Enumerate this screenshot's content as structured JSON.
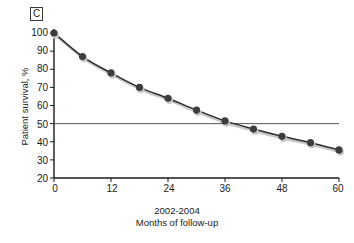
{
  "panel": {
    "label": "C"
  },
  "chart_data": {
    "type": "line",
    "title": "",
    "subtitle": "",
    "xlabel": "Months of follow-up",
    "xlabel_secondary": "2002-2004",
    "ylabel": "Patient survival, %",
    "xlim": [
      0,
      60
    ],
    "ylim": [
      20,
      100
    ],
    "grid": false,
    "legend": null,
    "x": [
      0,
      6,
      12,
      18,
      24,
      30,
      36,
      42,
      48,
      54,
      60
    ],
    "values": [
      100,
      87,
      78,
      70,
      64,
      57.5,
      51.5,
      47,
      43,
      39.5,
      35.5
    ],
    "series": [
      {
        "name": "Patient survival",
        "values": [
          100,
          87,
          78,
          70,
          64,
          57.5,
          51.5,
          47,
          43,
          39.5,
          35.5
        ]
      }
    ],
    "xticks": [
      0,
      12,
      24,
      36,
      48,
      60
    ],
    "xtick_labels": [
      "0",
      "12",
      "24",
      "36",
      "48",
      "60"
    ],
    "yticks": [
      20,
      30,
      40,
      50,
      60,
      70,
      80,
      90,
      100
    ],
    "ytick_labels": [
      "20",
      "30",
      "40",
      "50",
      "60",
      "70",
      "80",
      "90",
      "100"
    ],
    "annotations": [
      {
        "name": "median-survival-reference-line",
        "type": "hline",
        "y": 50,
        "label": ""
      }
    ],
    "colors": {
      "marker": "#3d3d3d",
      "line": "#2b2b2b",
      "reference_line": "#555555",
      "axis": "#1a1a1a",
      "shadow": "#c8c8c8",
      "background": "#ffffff"
    }
  }
}
